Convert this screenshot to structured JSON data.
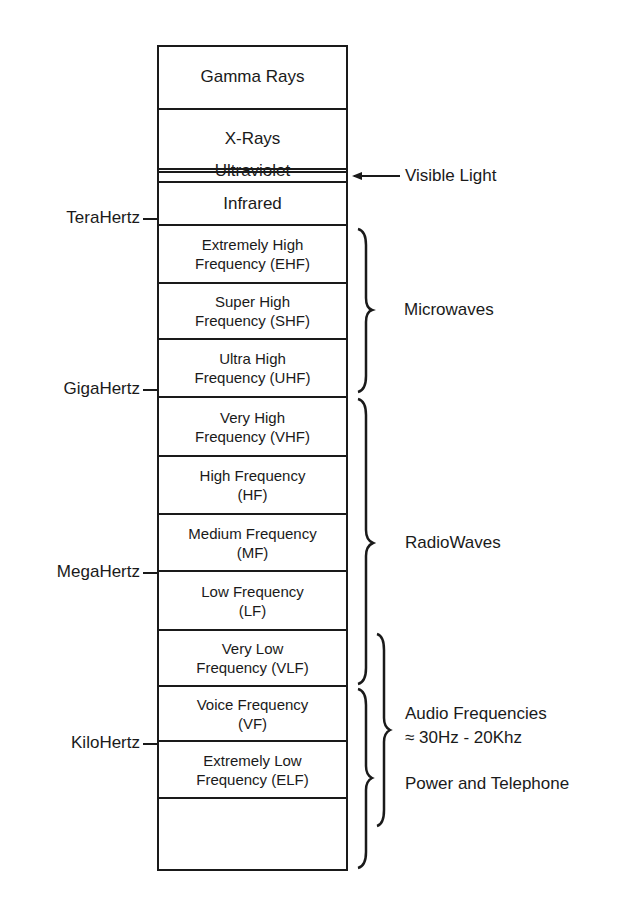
{
  "bands": [
    {
      "label": "Gamma Rays",
      "top": 0,
      "height": 64,
      "size": "big"
    },
    {
      "label": "X-Rays",
      "top": 64,
      "height": 63,
      "size": "big"
    },
    {
      "label": "Ultraviolet",
      "top": 127,
      "height": 55,
      "size": "big"
    },
    {
      "label": "",
      "top": 182,
      "height": 10,
      "size": "big"
    },
    {
      "label": "Infrared",
      "top": 136,
      "height": 0,
      "size": "big"
    },
    {
      "label": "Extremely High\nFrequency (EHF)",
      "top": 0,
      "height": 0,
      "size": "small"
    },
    {
      "label": "Super High\nFrequency (SHF)",
      "top": 0,
      "height": 0,
      "size": "small"
    },
    {
      "label": "Ultra High\nFrequency (UHF)",
      "top": 0,
      "height": 0,
      "size": "small"
    },
    {
      "label": "Very High\nFrequency (VHF)",
      "top": 0,
      "height": 0,
      "size": "small"
    },
    {
      "label": "High Frequency\n(HF)",
      "top": 0,
      "height": 0,
      "size": "small"
    },
    {
      "label": "Medium Frequency\n(MF)",
      "top": 0,
      "height": 0,
      "size": "small"
    },
    {
      "label": "Low Frequency\n(LF)",
      "top": 0,
      "height": 0,
      "size": "small"
    },
    {
      "label": "Very Low\nFrequency (VLF)",
      "top": 0,
      "height": 0,
      "size": "small"
    },
    {
      "label": "Voice Frequency\n(VF)",
      "top": 0,
      "height": 0,
      "size": "small"
    },
    {
      "label": "Extremely Low\nFrequency (ELF)",
      "top": 0,
      "height": 0,
      "size": "small"
    },
    {
      "label": "",
      "top": 0,
      "height": 0,
      "size": "small"
    }
  ],
  "boundaries_y": [
    45,
    108,
    170,
    173,
    183,
    226,
    284,
    340,
    398,
    457,
    515,
    572,
    631,
    687,
    742,
    799,
    871
  ],
  "frequency_markers": [
    {
      "label": "TeraHertz",
      "y": 219
    },
    {
      "label": "GigaHertz",
      "y": 390
    },
    {
      "label": "MegaHertz",
      "y": 573
    },
    {
      "label": "KiloHertz",
      "y": 744
    }
  ],
  "annotations": {
    "visible_light": "Visible Light",
    "microwaves": "Microwaves",
    "radiowaves": "RadioWaves",
    "audio_line1": "Audio Frequencies",
    "audio_line2": "≈ 30Hz - 20Khz",
    "power_telephone": "Power and Telephone"
  }
}
